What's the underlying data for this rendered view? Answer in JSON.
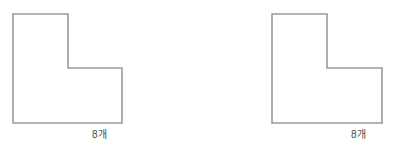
{
  "page": {
    "background_color": "#ffffff",
    "width": 398,
    "height": 158
  },
  "style": {
    "stroke_color": "#9a9a9a",
    "fill_color": "#ffffff",
    "caption_color": "#4a4a4a",
    "stroke_width": 1.6
  },
  "figures": [
    {
      "id": "figure-left",
      "name": "l-shape-left",
      "caption": "8개",
      "shape": {
        "type": "l-shape-polygon",
        "unit_count": 8,
        "points": "13,14 68,14 68,68 122,68 122,123 13,123",
        "vertices": [
          {
            "x": 13,
            "y": 14
          },
          {
            "x": 68,
            "y": 14
          },
          {
            "x": 68,
            "y": 68
          },
          {
            "x": 122,
            "y": 68
          },
          {
            "x": 122,
            "y": 123
          },
          {
            "x": 13,
            "y": 123
          }
        ]
      }
    },
    {
      "id": "figure-right",
      "name": "l-shape-right",
      "caption": "8개",
      "shape": {
        "type": "l-shape-polygon",
        "unit_count": 8,
        "points": "73,14 128,14 128,68 183,68 183,123 73,123",
        "vertices": [
          {
            "x": 73,
            "y": 14
          },
          {
            "x": 128,
            "y": 14
          },
          {
            "x": 128,
            "y": 68
          },
          {
            "x": 183,
            "y": 68
          },
          {
            "x": 183,
            "y": 123
          },
          {
            "x": 73,
            "y": 123
          }
        ]
      }
    }
  ]
}
